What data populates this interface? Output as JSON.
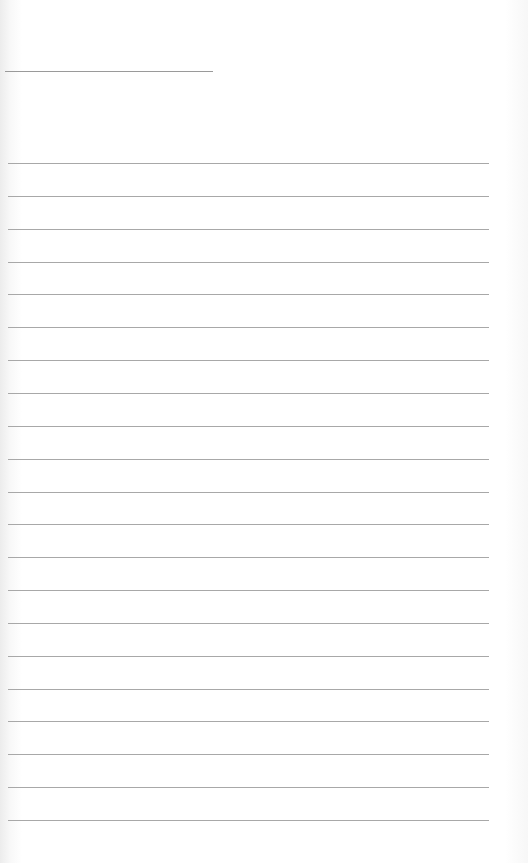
{
  "page": {
    "type": "lined-notebook-paper",
    "header_line": {
      "x": 5,
      "y": 71,
      "width": 208
    },
    "rules": {
      "count": 21,
      "start_y": 163,
      "spacing": 32.85,
      "left": 8,
      "width": 481
    },
    "colors": {
      "paper": "#ffffff",
      "line": "#a8a8a8",
      "edge_shadow": "#ececec"
    }
  }
}
